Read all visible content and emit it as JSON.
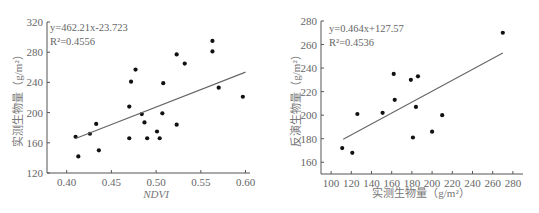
{
  "chart_data": [
    {
      "type": "scatter",
      "title": "",
      "xlabel": "NDVI",
      "ylabel": "实测生物量（g/m²）",
      "xlim": [
        0.378,
        0.605
      ],
      "ylim": [
        120,
        320
      ],
      "xticks": [
        "0.40",
        "0.45",
        "0.50",
        "0.55",
        "0.60"
      ],
      "yticks": [
        "120",
        "160",
        "200",
        "240",
        "280",
        "320"
      ],
      "grid": false,
      "equation": "y=462.21x-23.723",
      "r2_label": "R²=0.4556",
      "fit": {
        "slope": 462.21,
        "intercept": -23.723,
        "x_range": [
          0.41,
          0.6
        ]
      },
      "series": [
        {
          "name": "observations",
          "points": [
            [
              0.41,
              168
            ],
            [
              0.413,
              142
            ],
            [
              0.426,
              172
            ],
            [
              0.433,
              185
            ],
            [
              0.436,
              150
            ],
            [
              0.47,
              208
            ],
            [
              0.47,
              166
            ],
            [
              0.472,
              241
            ],
            [
              0.477,
              257
            ],
            [
              0.484,
              198
            ],
            [
              0.487,
              187
            ],
            [
              0.49,
              166
            ],
            [
              0.501,
              175
            ],
            [
              0.504,
              166
            ],
            [
              0.507,
              199
            ],
            [
              0.508,
              239
            ],
            [
              0.523,
              184
            ],
            [
              0.523,
              277
            ],
            [
              0.532,
              265
            ],
            [
              0.563,
              281
            ],
            [
              0.563,
              295
            ],
            [
              0.57,
              233
            ],
            [
              0.597,
              221
            ]
          ]
        }
      ]
    },
    {
      "type": "scatter",
      "title": "",
      "xlabel": "实测生物量（g/m²）",
      "ylabel": "反演生物量（g/m²）",
      "xlim": [
        90,
        290
      ],
      "ylim": [
        150,
        280
      ],
      "xticks": [
        "100",
        "120",
        "140",
        "160",
        "180",
        "200",
        "220",
        "240",
        "260",
        "280"
      ],
      "yticks": [
        "160",
        "180",
        "200",
        "220",
        "240",
        "260",
        "280"
      ],
      "grid": false,
      "equation": "y=0.464x+127.57",
      "r2_label": "R²=0.4536",
      "fit": {
        "slope": 0.464,
        "intercept": 127.57,
        "x_range": [
          112,
          270
        ]
      },
      "series": [
        {
          "name": "observations",
          "points": [
            [
              111,
              172
            ],
            [
              121,
              168
            ],
            [
              126,
              201
            ],
            [
              151,
              202
            ],
            [
              162,
              235
            ],
            [
              163,
              213
            ],
            [
              179,
              230
            ],
            [
              181,
              181
            ],
            [
              184,
              207
            ],
            [
              186,
              233
            ],
            [
              200,
              186
            ],
            [
              210,
              200
            ],
            [
              270,
              270
            ]
          ]
        }
      ]
    }
  ],
  "left": {
    "equation": "y=462.21x-23.723",
    "r2": "R²=0.4556",
    "xlabel": "NDVI",
    "ylabel": "实测生物量（g/m²）"
  },
  "right": {
    "equation": "y=0.464x+127.57",
    "r2": "R²=0.4536",
    "xlabel": "实测生物量（g/m²）",
    "ylabel": "反演生物量（g/m²）"
  }
}
